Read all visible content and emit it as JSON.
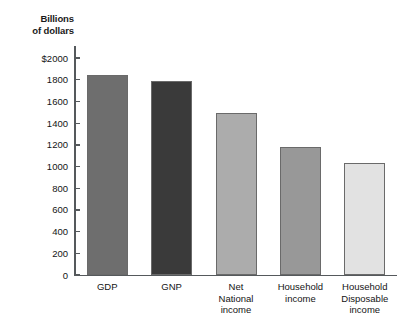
{
  "chart_data": {
    "type": "bar",
    "title": "",
    "subtitle": "",
    "axis_title": "Billions\nof dollars",
    "xlabel": "",
    "ylabel": "Billions of dollars",
    "ylim": [
      0,
      2000
    ],
    "grid": false,
    "legend": "none",
    "categories": [
      "GDP",
      "GNP",
      "Net\nNational\nincome",
      "Household\nincome",
      "Household\nDisposable\nincome"
    ],
    "values": [
      1845,
      1790,
      1490,
      1180,
      1030
    ],
    "bar_colors": [
      "#6e6e6e",
      "#3a3a3a",
      "#acacac",
      "#989898",
      "#e2e2e2"
    ],
    "y_ticks": [
      {
        "value": 2000,
        "label": "$2000"
      },
      {
        "value": 1800,
        "label": "1800"
      },
      {
        "value": 1600,
        "label": "1600"
      },
      {
        "value": 1400,
        "label": "1400"
      },
      {
        "value": 1200,
        "label": "1200"
      },
      {
        "value": 1000,
        "label": "1000"
      },
      {
        "value": 800,
        "label": "800"
      },
      {
        "value": 600,
        "label": "600"
      },
      {
        "value": 400,
        "label": "400"
      },
      {
        "value": 200,
        "label": "200"
      },
      {
        "value": 0,
        "label": "0"
      }
    ],
    "axis_color": "#55595c",
    "text_color": "#141414"
  }
}
